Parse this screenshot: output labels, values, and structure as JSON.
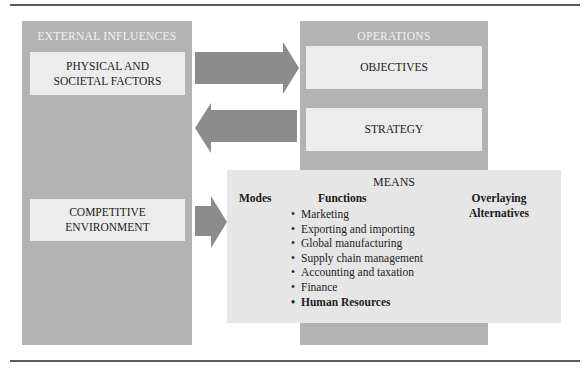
{
  "diagram": {
    "external_influences": {
      "title": "EXTERNAL INFLUENCES",
      "physical_societal": [
        "PHYSICAL AND",
        "SOCIETAL FACTORS"
      ],
      "competitive": [
        "COMPETITIVE",
        "ENVIRONMENT"
      ]
    },
    "operations": {
      "title": "OPERATIONS",
      "objectives": "OBJECTIVES",
      "strategy": "STRATEGY"
    },
    "means": {
      "title": "MEANS",
      "modes": "Modes",
      "functions": "Functions",
      "overlaying": [
        "Overlaying",
        "Alternatives"
      ],
      "function_items": [
        "Marketing",
        "Exporting and importing",
        "Global manufacturing",
        "Supply chain management",
        "Accounting and taxation",
        "Finance",
        "Human Resources"
      ]
    },
    "arrows": [
      {
        "from": "external-influences",
        "to": "operations",
        "direction": "right"
      },
      {
        "from": "operations",
        "to": "external-influences",
        "direction": "left"
      },
      {
        "from": "competitive-environment",
        "to": "means",
        "direction": "right"
      }
    ],
    "colors": {
      "panel": "#b3b3b3",
      "inner_box": "#ececec",
      "means_box": "#e6e6e6",
      "arrow": "#8c8c8c",
      "rule": "#5a5a5a"
    }
  }
}
